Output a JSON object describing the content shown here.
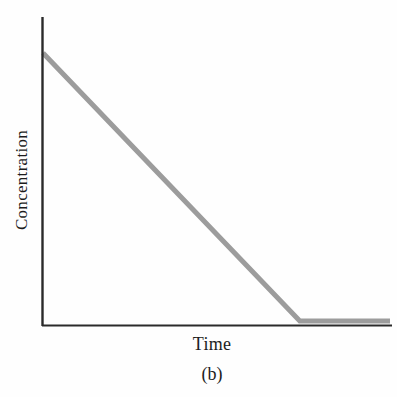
{
  "chart_data": {
    "type": "line",
    "title": "",
    "subtitle": "",
    "caption": "(b)",
    "xlabel": "Time",
    "ylabel": "Concentration",
    "grid": false,
    "legend": null,
    "axis_ticks": {
      "x": [],
      "y": []
    },
    "xlim": [
      0,
      100
    ],
    "ylim": [
      0,
      100
    ],
    "series": [
      {
        "name": "Concentration vs Time",
        "color": "#9c9c9c",
        "linewidth": 5,
        "x": [
          0,
          74,
          100
        ],
        "y": [
          88,
          1.5,
          1.5
        ],
        "description": "Zero-order decay: concentration falls linearly from its initial value to zero, then remains flat at zero."
      }
    ],
    "annotations": [],
    "axis_color": "#2a2a2a",
    "background": "#fefefe"
  },
  "figure": {
    "y_axis_title": "Concentration",
    "x_axis_title": "Time",
    "panel_label": "(b)"
  }
}
